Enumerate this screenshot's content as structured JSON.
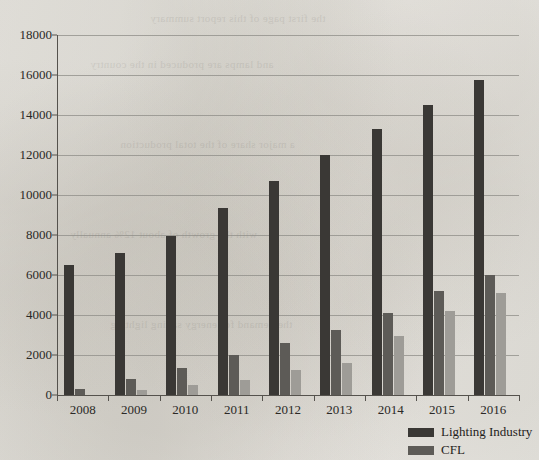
{
  "chart_data": {
    "type": "bar",
    "title": "",
    "subtitle": "",
    "xlabel": "",
    "ylabel": "",
    "categories": [
      "2008",
      "2009",
      "2010",
      "2011",
      "2012",
      "2013",
      "2014",
      "2015",
      "2016"
    ],
    "series": [
      {
        "name": "Lighting Industry",
        "color": "#3a3835",
        "values": [
          6500,
          7100,
          7950,
          9350,
          10700,
          12000,
          13300,
          14500,
          15750
        ]
      },
      {
        "name": "CFL",
        "color": "#5d5b57",
        "values": [
          280,
          820,
          1370,
          1980,
          2620,
          3230,
          4080,
          5200,
          5980
        ]
      },
      {
        "name": "",
        "color": "#9e9c97",
        "values": [
          0,
          270,
          480,
          760,
          1250,
          1620,
          2950,
          4200,
          5080
        ]
      }
    ],
    "ylim": [
      0,
      18000
    ],
    "y_tick_labels": [
      "0",
      "2000",
      "4000",
      "6000",
      "8000",
      "10000",
      "12000",
      "14000",
      "16000",
      "18000"
    ],
    "y_tick_values": [
      0,
      2000,
      4000,
      6000,
      8000,
      10000,
      12000,
      14000,
      16000,
      18000
    ],
    "grid": true,
    "grid_axis": "y",
    "legend_position": "bottom-right",
    "legend_entries": [
      "Lighting Industry",
      "CFL"
    ],
    "bar_colors": {
      "lighting_industry": "#3a3835",
      "cfl": "#5d5b57",
      "third_series": "#9e9c97"
    }
  },
  "page": {
    "background_color": "#ebeae6",
    "axis_color": "#55524d",
    "gridline_color": "#8e8c87",
    "text_color": "#2b2926"
  },
  "bleed_through_text": [
    "the first page of this report summary",
    "and lamps are produced in the country",
    "a major share of the total production",
    "with the growth of about 12% annually",
    "the demand for energy saving lighting"
  ]
}
